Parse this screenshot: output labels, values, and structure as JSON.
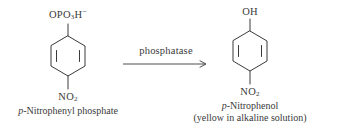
{
  "reaction": {
    "reactant": {
      "substituent_top": {
        "prefix": "OPO",
        "sub": "3",
        "suffix": "H",
        "charge": "−"
      },
      "substituent_bottom": {
        "text": "NO",
        "sub": "2"
      },
      "name_prefix": "p",
      "name_rest": "-Nitrophenyl phosphate"
    },
    "arrow": {
      "label": "phosphatase",
      "direction": "right"
    },
    "product": {
      "substituent_top": {
        "text": "OH"
      },
      "substituent_bottom": {
        "text": "NO",
        "sub": "2"
      },
      "name_prefix": "p",
      "name_rest": "-Nitrophenol",
      "note": "(yellow in alkaline solution)"
    }
  },
  "style": {
    "ink": "#3a3a3a",
    "background": "#ffffff"
  }
}
